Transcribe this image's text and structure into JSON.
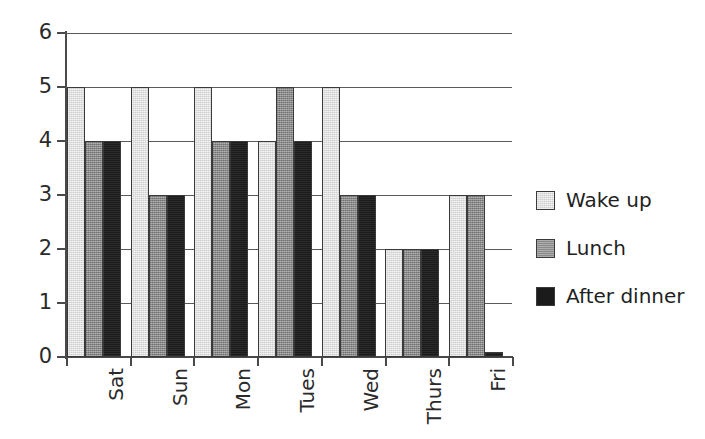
{
  "chart_data": {
    "type": "bar",
    "title": "",
    "subtitle": "",
    "xlabel": "",
    "ylabel": "",
    "categories": [
      "Sat",
      "Sun",
      "Mon",
      "Tues",
      "Wed",
      "Thurs",
      "Fri"
    ],
    "series": [
      {
        "name": "Wake up",
        "color": "#cfcfcf",
        "values": [
          5,
          5,
          5,
          4,
          5,
          2,
          3
        ]
      },
      {
        "name": "Lunch",
        "color": "#8a8a8a",
        "values": [
          4,
          3,
          4,
          5,
          3,
          2,
          3
        ]
      },
      {
        "name": "After dinner",
        "color": "#1b1b1b",
        "values": [
          4,
          3,
          4,
          4,
          3,
          2,
          0.1
        ]
      }
    ],
    "ylim": [
      0,
      6
    ],
    "ytick_labels": [
      "0",
      "1",
      "2",
      "3",
      "4",
      "5",
      "6"
    ],
    "ytick_values": [
      0,
      1,
      2,
      3,
      4,
      5,
      6
    ],
    "grid": true,
    "grid_axis": "y",
    "legend_position": "right",
    "annotations": []
  },
  "legend": {
    "entries": [
      {
        "label": "Wake up"
      },
      {
        "label": "Lunch"
      },
      {
        "label": "After dinner"
      }
    ]
  },
  "axes": {
    "y": {
      "min": 0,
      "max": 6,
      "labels": [
        "0",
        "1",
        "2",
        "3",
        "4",
        "5",
        "6"
      ]
    },
    "x": {
      "labels": [
        "Sat",
        "Sun",
        "Mon",
        "Tues",
        "Wed",
        "Thurs",
        "Fri"
      ]
    }
  }
}
